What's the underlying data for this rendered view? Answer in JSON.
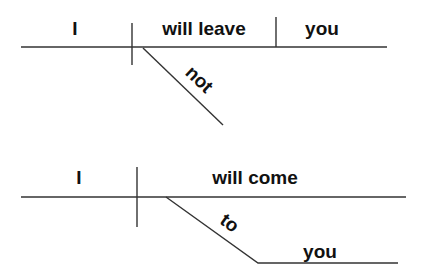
{
  "diagrams": [
    {
      "sentence_type": "negated",
      "subject": "I",
      "verb": "will leave",
      "object": "you",
      "modifier": "not"
    },
    {
      "sentence_type": "prepositional",
      "subject": "I",
      "verb": "will come",
      "preposition": "to",
      "prepositional_object": "you"
    }
  ],
  "colors": {
    "line": "#333333",
    "text": "#111111"
  }
}
